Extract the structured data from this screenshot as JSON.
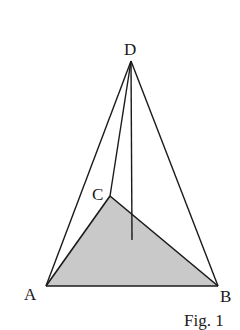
{
  "figure": {
    "caption": "Fig. 1",
    "type": "tetrahedron",
    "shaded_face_color": "#c9c9c9",
    "line_color": "#1a1a1a",
    "points": {
      "A": {
        "label": "A",
        "x": 46,
        "y": 286
      },
      "B": {
        "label": "B",
        "x": 218,
        "y": 286
      },
      "C": {
        "label": "C",
        "x": 110,
        "y": 196
      },
      "D": {
        "label": "D",
        "x": 131,
        "y": 61
      },
      "H": {
        "x": 132,
        "y": 240
      }
    },
    "edges": [
      "AB",
      "BC",
      "CA",
      "DA",
      "DB",
      "DC"
    ],
    "altitude": "DH",
    "shaded_face": "ABC"
  }
}
